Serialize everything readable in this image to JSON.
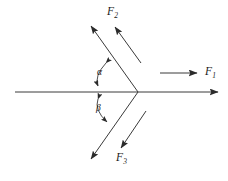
{
  "figure": {
    "background_color": "#ffffff",
    "line_color": "#333333",
    "text_color": "#1a1a1a"
  },
  "labels": {
    "f1": {
      "base": "F",
      "sub": "1"
    },
    "f2": {
      "base": "F",
      "sub": "2"
    },
    "f3": {
      "base": "F",
      "sub": "3"
    },
    "alpha": "α",
    "beta": "β"
  },
  "geometry": {
    "vertex": {
      "x": 138,
      "y": 92
    },
    "axis": {
      "x1": 15,
      "y1": 92,
      "x2": 222,
      "y2": 92,
      "arrow": "right"
    },
    "f1_arrow": {
      "x1": 160,
      "y1": 73,
      "x2": 201,
      "y2": 73,
      "arrow": "right"
    },
    "f2_ray": {
      "x1": 138,
      "y1": 92,
      "x2": 88,
      "y2": 22,
      "arrow": "upper-left"
    },
    "f2_parallel": {
      "x1": 141,
      "y1": 63,
      "x2": 112,
      "y2": 23,
      "arrow": "upper-left"
    },
    "f3_ray": {
      "x1": 138,
      "y1": 92,
      "x2": 88,
      "y2": 163,
      "arrow": "lower-left"
    },
    "f3_parallel": {
      "x1": 146,
      "y1": 111,
      "x2": 118,
      "y2": 152,
      "arrow": "lower-left"
    },
    "alpha_arc": {
      "center_x": 97,
      "top_y": 62,
      "bottom_y": 88
    },
    "beta_arc": {
      "center_x": 97,
      "top_y": 97,
      "bottom_y": 124
    }
  }
}
